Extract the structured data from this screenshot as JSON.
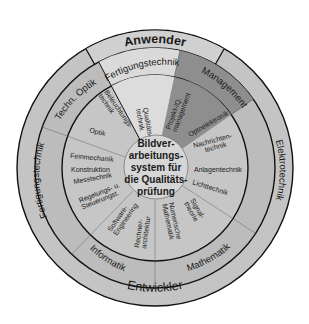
{
  "diagram": {
    "title_center": [
      "Bildver-",
      "arbeitungs-",
      "system für",
      "die Qualitäts-",
      "prüfung"
    ],
    "outer_ring": {
      "top_label": "Anwender",
      "bottom_label": "Entwickler"
    },
    "disciplines": [
      {
        "label": "Fertigungstechnik",
        "position": "top",
        "color": "#d8d8d8"
      },
      {
        "label": "Management",
        "position": "top-right",
        "color": "#8c8c8c"
      },
      {
        "label": "Elektrotechnik",
        "position": "right",
        "color": "#bdbdbd"
      },
      {
        "label": "Mathematik",
        "position": "bottom-right",
        "color": "#bdbdbd"
      },
      {
        "label": "Informatik",
        "position": "bottom-left",
        "color": "#bdbdbd"
      },
      {
        "label": "Fertigungstechnik",
        "position": "left",
        "color": "#bdbdbd"
      },
      {
        "label": "Techn. Optik",
        "position": "top-left",
        "color": "#bdbdbd"
      }
    ],
    "topics": {
      "qualitaetstechnik": [
        "Qualitäts-",
        "technik"
      ],
      "projekt_q_management": [
        "Projekt-/Q.",
        "management"
      ],
      "optoelektronik": "Optoelektronik",
      "nachrichtentechnik": [
        "Nachrichten-",
        "technik"
      ],
      "anlagentechnik": "Anlagentechnik",
      "lichttechnik": "Lichttechnik",
      "signaltheorie": [
        "Signal-",
        "theorie"
      ],
      "numerische_mathematik": [
        "Numerische",
        "Mathematik"
      ],
      "rechnerarchitektur": [
        "Rechner-",
        "architektur"
      ],
      "software_engineering": [
        "Software-",
        "Engineering"
      ],
      "regelungs_steuerungstechnik": [
        "Regelungs- u.",
        "Steuerungst."
      ],
      "messtechnik": "Messtechnik",
      "konstruktion": "Konstruktion",
      "feinmechanik": "Feinmechanik",
      "optik": "Optik",
      "beleuchtungstechnik": [
        "Beleuchtungs-",
        "technik"
      ]
    },
    "colors": {
      "ring_fill": "#bdbdbd",
      "light_fill": "#d9d9d9",
      "dark_fill": "#8c8c8c",
      "center_fill": "#d4d4d4",
      "line": "#111111"
    }
  }
}
